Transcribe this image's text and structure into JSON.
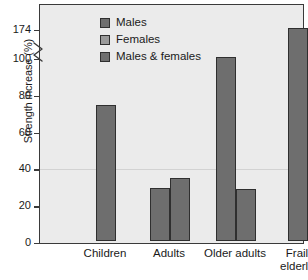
{
  "panel": {
    "tag": "(a)"
  },
  "chart_data": {
    "type": "bar",
    "title": "",
    "subtitle": "",
    "xlabel": "",
    "ylabel": "Strength increase (%)",
    "ylim": [
      0,
      174
    ],
    "y_axis_break": true,
    "y_break_between": [
      100,
      174
    ],
    "yticks": [
      {
        "value": 0,
        "label": "0"
      },
      {
        "value": 20,
        "label": "20"
      },
      {
        "value": 40,
        "label": "40"
      },
      {
        "value": 60,
        "label": "60"
      },
      {
        "value": 80,
        "label": "80"
      },
      {
        "value": 100,
        "label": "100"
      },
      {
        "value": 174,
        "label": "174"
      }
    ],
    "grid": "faint-horizontal-at-40",
    "legend_position": "top-left",
    "legend": [
      {
        "name": "Males",
        "color": "#6e6e6e"
      },
      {
        "name": "Females",
        "color": "#9a9a9a"
      },
      {
        "name": "Males & females",
        "color": "#6e6e6e"
      }
    ],
    "categories": [
      "Children",
      "Adults",
      "Older adults",
      "Frail elderly"
    ],
    "series": [
      {
        "name": "Males",
        "values": [
          null,
          29,
          100,
          null
        ]
      },
      {
        "name": "Females",
        "values": [
          null,
          34,
          28,
          null
        ]
      },
      {
        "name": "Males & females",
        "values": [
          74,
          null,
          null,
          174
        ]
      }
    ],
    "bars": [
      {
        "category": "Children",
        "series": "Males & females",
        "value": 74,
        "color": "#6e6e6e"
      },
      {
        "category": "Adults",
        "series": "Males",
        "value": 29,
        "color": "#6e6e6e"
      },
      {
        "category": "Adults",
        "series": "Females",
        "value": 34,
        "color": "#6e6e6e"
      },
      {
        "category": "Older adults",
        "series": "Males",
        "value": 100,
        "color": "#6e6e6e"
      },
      {
        "category": "Older adults",
        "series": "Females",
        "value": 28,
        "color": "#6e6e6e"
      },
      {
        "category": "Frail elderly",
        "series": "Males & females",
        "value": 174,
        "color": "#6e6e6e"
      }
    ],
    "xtick_labels": [
      "Children",
      "Adults",
      "Older adults",
      "Frail\nelderly"
    ]
  },
  "colors": {
    "plot_background": "#ebebeb",
    "axis": "#3a3a3a",
    "bar_dark": "#6e6e6e",
    "bar_light": "#9a9a9a",
    "gridline": "#d2d2d2"
  }
}
